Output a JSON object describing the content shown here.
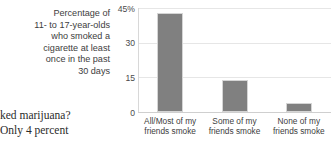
{
  "page_text": {
    "lines": [
      "ked marijuana?",
      "Only 4 percent"
    ]
  },
  "caption": {
    "lines": [
      "Percentage of",
      "11- to 17-year-olds",
      "who smoked a",
      "cigarette at least",
      "once in the past",
      "30 days"
    ]
  },
  "chart_data": {
    "type": "bar",
    "title": "",
    "xlabel": "",
    "ylabel": "",
    "categories": [
      "All/Most of my friends smoke",
      "Some of my friends smoke",
      "None of my friends smoke"
    ],
    "category_lines": [
      [
        "All/Most of my",
        "friends smoke"
      ],
      [
        "Some of my",
        "friends smoke"
      ],
      [
        "None of my",
        "friends smoke"
      ]
    ],
    "values": [
      43,
      14,
      4
    ],
    "ylim": [
      0,
      45
    ],
    "yticks": [
      45,
      30,
      15,
      0
    ],
    "ytick_labels": [
      "45%",
      "30",
      "15",
      "0"
    ],
    "grid": true,
    "legend": "none",
    "bar_color": "#808080",
    "grid_color": "#e6e6e6",
    "axis_color": "#cfcfcf"
  }
}
